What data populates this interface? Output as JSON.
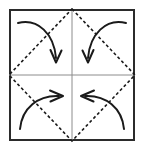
{
  "figure": {
    "title": "Origami fold step: fold four corners to center",
    "type": "origami-fold-diagram",
    "canvas": {
      "width": 144,
      "height": 153
    },
    "background_color": "#ffffff"
  },
  "paper": {
    "shape_name": "square-sheet-outline",
    "stroke_color": "#2b2b2b",
    "fill_color": "#ffffff",
    "stroke_width": 2,
    "left": 9,
    "top": 9,
    "right": 135,
    "bottom": 141
  },
  "center_lines": {
    "shape_name": "existing-crease-center-cross",
    "stroke_color": "#8c8c8c",
    "stroke_width": 1,
    "style": "solid",
    "horizontal": {
      "x1": 9,
      "y1": 75,
      "x2": 135,
      "y2": 75
    },
    "vertical": {
      "x1": 72,
      "y1": 9,
      "x2": 72,
      "y2": 141
    }
  },
  "fold_lines": {
    "shape_name": "fold-crease-diamond",
    "stroke_color": "#1a1a1a",
    "stroke_width": 1.6,
    "style": "dashed",
    "dash_pattern": "3,2.5",
    "points": [
      {
        "label": "top-midpoint",
        "x": 72,
        "y": 9
      },
      {
        "label": "right-midpoint",
        "x": 135,
        "y": 75
      },
      {
        "label": "bottom-midpoint",
        "x": 72,
        "y": 141
      },
      {
        "label": "left-midpoint",
        "x": 9,
        "y": 75
      }
    ]
  },
  "arrows": {
    "stroke_color": "#1a1a1a",
    "stroke_width": 2,
    "items": [
      {
        "name": "fold-arrow-top-left",
        "direction": "down-right-to-center",
        "path": "M 18 23 C 38 18, 54 34, 56 58",
        "head": "M 50.5 50 L 56 62.5 L 61.5 50.5"
      },
      {
        "name": "fold-arrow-top-right",
        "direction": "down-left-to-center",
        "path": "M 126 23 C 106 18, 90 34, 88 58",
        "head": "M 82.5 50.5 L 88 62.5 L 93.5 50"
      },
      {
        "name": "fold-arrow-bottom-left",
        "direction": "up-right-to-center",
        "path": "M 20 129 C 22 108, 38 95, 59 96",
        "head": "M 50 90.5 L 63 96 L 50.5 101.5"
      },
      {
        "name": "fold-arrow-bottom-right",
        "direction": "up-left-to-center",
        "path": "M 124 129 C 122 108, 106 95, 85 96",
        "head": "M 94 90.5 L 81 96 L 93.5 101.5"
      }
    ]
  }
}
